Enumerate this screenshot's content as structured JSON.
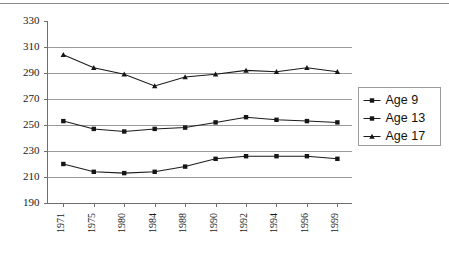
{
  "chart_data": {
    "type": "line",
    "title": "",
    "subtitle": "",
    "xlabel": "",
    "ylabel": "",
    "categories": [
      "1971",
      "1975",
      "1980",
      "1984",
      "1988",
      "1990",
      "1992",
      "1994",
      "1996",
      "1999"
    ],
    "x": [
      1971,
      1975,
      1980,
      1984,
      1988,
      1990,
      1992,
      1994,
      1996,
      1999
    ],
    "ylim": [
      190,
      330
    ],
    "yticks": [
      190,
      210,
      230,
      250,
      270,
      290,
      310,
      330
    ],
    "ytick_labels": [
      "190",
      "210",
      "230",
      "250",
      "270",
      "290",
      "310",
      "330"
    ],
    "grid": true,
    "grid_axis": "y",
    "legend_position": "right",
    "xtick_rotation": 90,
    "series": [
      {
        "name": "Age 9",
        "color": "#1b1b1b",
        "marker": "square",
        "values": [
          220,
          214,
          213,
          214,
          218,
          224,
          226,
          226,
          226,
          224
        ]
      },
      {
        "name": "Age 13",
        "color": "#1b1b1b",
        "marker": "square",
        "values": [
          253,
          247,
          245,
          247,
          248,
          252,
          256,
          254,
          253,
          252
        ]
      },
      {
        "name": "Age 17",
        "color": "#1b1b1b",
        "marker": "triangle",
        "values": [
          304,
          294,
          289,
          280,
          287,
          289,
          292,
          291,
          294,
          291
        ]
      }
    ]
  },
  "legend": {
    "entries": [
      {
        "label": "Age 9"
      },
      {
        "label": "Age 13"
      },
      {
        "label": "Age 17"
      }
    ]
  }
}
